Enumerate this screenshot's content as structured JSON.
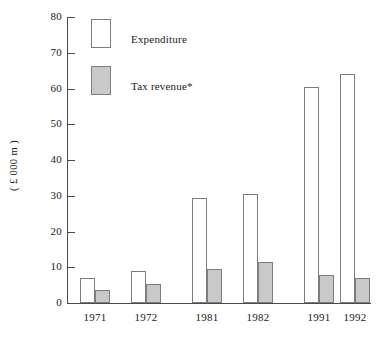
{
  "chart_data": {
    "type": "bar",
    "title": "",
    "subtitle": "",
    "xlabel": "",
    "ylabel": "( £ 000 m )",
    "categories": [
      "1971",
      "1972",
      "1981",
      "1982",
      "1991",
      "1992"
    ],
    "series": [
      {
        "name": "Expenditure",
        "color": "#ffffff",
        "values": [
          7.0,
          9.0,
          29.5,
          30.5,
          60.3,
          64.0
        ]
      },
      {
        "name": "Tax revenue*",
        "color": "#c9c9c9",
        "values": [
          3.7,
          5.3,
          9.6,
          11.4,
          7.7,
          7.0
        ]
      }
    ],
    "ylim": [
      0,
      80
    ],
    "yticks": [
      0,
      10,
      20,
      30,
      40,
      50,
      60,
      70,
      80
    ],
    "ytick_labels": [
      "0",
      "10",
      "20",
      "30",
      "40",
      "50",
      "60",
      "70",
      "80"
    ],
    "grid": false,
    "legend_position": "upper-left-inside",
    "group_gaps_after": [
      "1972",
      "1982"
    ]
  },
  "legend": {
    "entries": [
      {
        "label": "Expenditure",
        "swatch": "white-rect-swatch"
      },
      {
        "label": "Tax revenue*",
        "swatch": "grey-rect-swatch"
      }
    ]
  },
  "axes": {
    "y_title": "( £ 000 m )"
  },
  "colors": {
    "expenditure_fill": "#ffffff",
    "tax_fill": "#c9c9c9",
    "bar_stroke": "#7d7d7d",
    "axis": "#4a4a4a",
    "text": "#1a1a1a",
    "background": "#ffffff"
  }
}
